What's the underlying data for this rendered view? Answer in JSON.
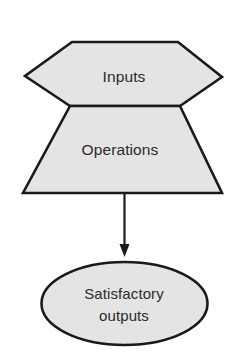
{
  "diagram": {
    "type": "flowchart",
    "background_color": "#ffffff",
    "shape_fill_color": "#e4e4e4",
    "shape_stroke_color": "#1a1a1a",
    "text_color": "#2b2b2b",
    "nodes": [
      {
        "id": "inputs",
        "shape": "hexagon",
        "label": "Inputs",
        "label_lines": [
          "Inputs"
        ]
      },
      {
        "id": "operations",
        "shape": "trapezoid",
        "label": "Operations",
        "label_lines": [
          "Operations"
        ]
      },
      {
        "id": "satisfactory-outputs",
        "shape": "ellipse",
        "label": "Satisfactory outputs",
        "label_lines": [
          "Satisfactory",
          "outputs"
        ]
      }
    ],
    "connectors": [
      {
        "id": "operations-to-outputs",
        "from": "operations",
        "to": "satisfactory-outputs",
        "style": "solid",
        "arrowhead": "filled-triangle"
      }
    ]
  }
}
